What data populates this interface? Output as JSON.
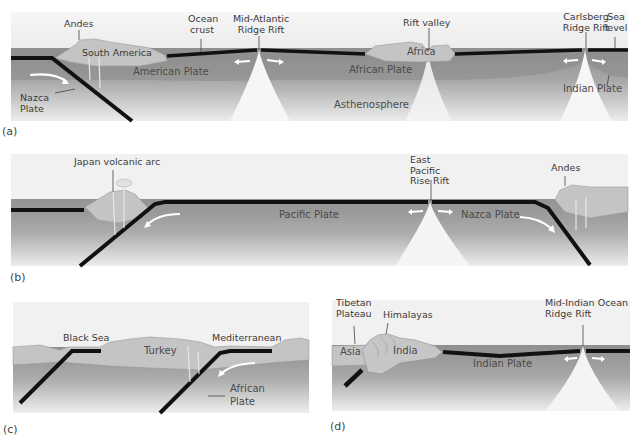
{
  "colors": {
    "background": "#ffffff",
    "sky": "#f2f2f2",
    "sea": "#b9b9b9",
    "land": "#c6c6c6",
    "plate": "#8e8e8e",
    "mantle_top": "#9a9a9a",
    "mantle_bottom": "#e6e6e6",
    "crust": "#111111",
    "rift_plume": "#f4f4f4",
    "arrow": "#ffffff",
    "text": "#3a3a3a"
  },
  "panels": {
    "a": {
      "tag": "(a)",
      "labels": {
        "andes": "Andes",
        "south_america": "South America",
        "ocean_crust": "Ocean crust",
        "mid_atlantic": "Mid-Atlantic Ridge Rift",
        "rift_valley": "Rift valley",
        "carlsberg": "Carlsberg Ridge Rift",
        "sea_level": "Sea level",
        "nazca_plate": "Nazca Plate",
        "american_plate": "American Plate",
        "africa": "Africa",
        "african_plate": "African Plate",
        "asthenosphere": "Asthenosphere",
        "indian_plate": "Indian Plate"
      }
    },
    "b": {
      "tag": "(b)",
      "labels": {
        "japan_arc": "Japan volcanic arc",
        "east_pacific": "East Pacific Rise Rift",
        "andes": "Andes",
        "pacific_plate": "Pacific Plate",
        "nazca_plate": "Nazca Plate"
      }
    },
    "c": {
      "tag": "(c)",
      "labels": {
        "black_sea": "Black Sea",
        "mediterranean": "Mediterranean",
        "turkey": "Turkey",
        "african_plate": "African Plate"
      }
    },
    "d": {
      "tag": "(d)",
      "labels": {
        "tibetan_plateau": "Tibetan Plateau",
        "himalayas": "Himalayas",
        "mid_indian": "Mid-Indian Ocean Ridge Rift",
        "asia": "Asia",
        "india": "India",
        "indian_plate": "Indian Plate"
      }
    }
  }
}
